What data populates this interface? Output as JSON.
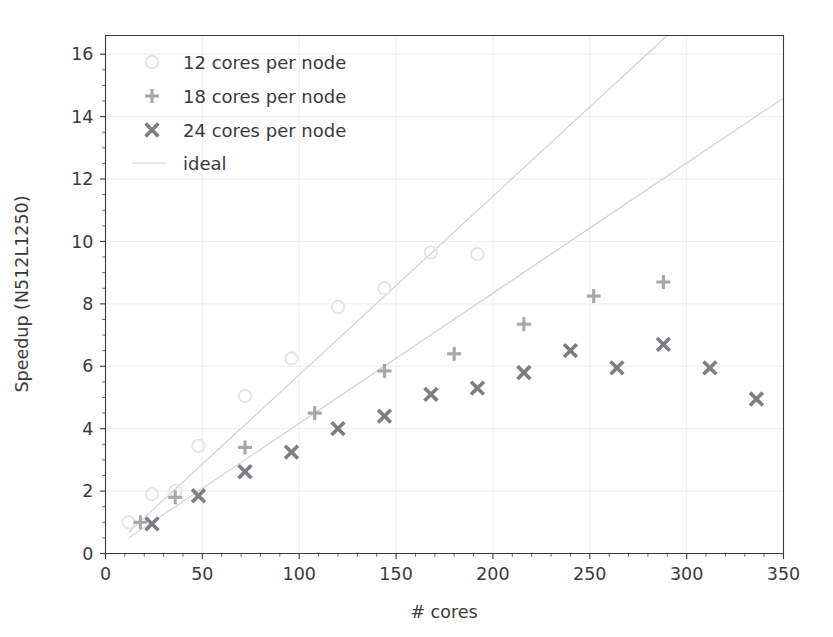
{
  "chart_data": {
    "type": "scatter",
    "title": "",
    "xlabel": "# cores",
    "ylabel": "Speedup (N512L1250)",
    "xlim": [
      0,
      350
    ],
    "ylim": [
      0,
      16.6
    ],
    "xticks": [
      0,
      50,
      100,
      150,
      200,
      250,
      300,
      350
    ],
    "yticks": [
      0,
      2,
      4,
      6,
      8,
      10,
      12,
      14,
      16
    ],
    "xtick_labels": [
      "0",
      "50",
      "100",
      "150",
      "200",
      "250",
      "300",
      "350"
    ],
    "ytick_labels": [
      "0",
      "2",
      "4",
      "6",
      "8",
      "10",
      "12",
      "14",
      "16"
    ],
    "grid": true,
    "legend_position": "upper left",
    "series": [
      {
        "name": "12 cores per node",
        "marker": "circle",
        "color": "#e4e4ea",
        "x": [
          12,
          24,
          36,
          48,
          72,
          96,
          120,
          144,
          168,
          192
        ],
        "y": [
          1.0,
          1.9,
          2.0,
          3.45,
          5.05,
          6.25,
          7.9,
          8.5,
          9.65,
          9.6
        ]
      },
      {
        "name": "18 cores per node",
        "marker": "plus",
        "color": "#a6a6ad",
        "x": [
          18,
          36,
          72,
          108,
          144,
          180,
          216,
          252,
          288
        ],
        "y": [
          1.0,
          1.8,
          3.4,
          4.5,
          5.85,
          6.4,
          7.35,
          8.25,
          8.7
        ]
      },
      {
        "name": "24 cores per node",
        "marker": "x",
        "color": "#7d7d85",
        "x": [
          24,
          48,
          72,
          96,
          120,
          144,
          168,
          192,
          216,
          240,
          264,
          288,
          312,
          336
        ],
        "y": [
          0.95,
          1.85,
          2.62,
          3.25,
          4.0,
          4.4,
          5.1,
          5.3,
          5.8,
          6.5,
          5.95,
          6.7,
          5.95,
          4.95
        ]
      }
    ],
    "reference_lines": [
      {
        "name": "ideal",
        "color": "#cfcfd8",
        "x": [
          12,
          290
        ],
        "y": [
          0.69,
          16.6
        ]
      },
      {
        "name": "ideal",
        "color": "#cfcfd8",
        "x": [
          12,
          350
        ],
        "y": [
          0.5,
          14.6
        ]
      }
    ],
    "legend": [
      {
        "label": "12 cores per node",
        "marker": "circle",
        "color": "#e4e4ea"
      },
      {
        "label": "18 cores per node",
        "marker": "plus",
        "color": "#a6a6ad"
      },
      {
        "label": "24 cores per node",
        "marker": "x",
        "color": "#7d7d85"
      },
      {
        "label": "ideal",
        "marker": "line",
        "color": "#cfcfd8"
      }
    ]
  },
  "axes": {
    "x_title": "# cores",
    "y_title": "Speedup (N512L1250)"
  }
}
